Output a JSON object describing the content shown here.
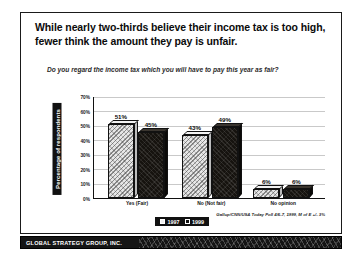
{
  "slide": {
    "title": "While nearly two-thirds believe their income tax is too high, fewer think the amount they pay is unfair.",
    "subtitle": "Do you regard the income tax which you will have to pay this year as fair?",
    "source": "Gallup/CNN/USA Today Poll 4/6-7, 1999, M of E +/- 3%"
  },
  "footer": {
    "brand": "GLOBAL STRATEGY GROUP, INC."
  },
  "chart_data": {
    "type": "bar",
    "title": "While nearly two-thirds believe their income tax is too high, fewer think the amount they pay is unfair.",
    "subtitle": "Do you regard the income tax which you will have to pay this year as fair?",
    "categories": [
      "Yes (Fair)",
      "No (Not fair)",
      "No opinion"
    ],
    "series": [
      {
        "name": "1997",
        "values": [
          51,
          43,
          6
        ],
        "labels": [
          "51%",
          "43%",
          "6%"
        ],
        "color": "#e6e6e6"
      },
      {
        "name": "1999",
        "values": [
          45,
          49,
          6
        ],
        "labels": [
          "45%",
          "49%",
          "6%"
        ],
        "color": "#16130f"
      }
    ],
    "xlabel": "",
    "ylabel": "Percentage of respondents",
    "ylim": [
      0,
      70
    ],
    "yticks": [
      70,
      60,
      50,
      40,
      30,
      20,
      10,
      0
    ],
    "ytick_labels": [
      "70%",
      "60%",
      "50%",
      "40%",
      "30%",
      "20%",
      "10%",
      "0%"
    ],
    "grid": true,
    "legend_position": "bottom",
    "source": "Gallup/CNN/USA Today Poll 4/6-7, 1999, M of E +/- 3%"
  }
}
